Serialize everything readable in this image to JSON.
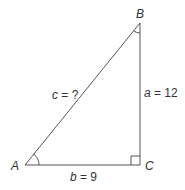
{
  "diagram": {
    "type": "right-triangle",
    "vertices": {
      "A": {
        "label": "A"
      },
      "B": {
        "label": "B"
      },
      "C": {
        "label": "C"
      }
    },
    "sides": {
      "a": {
        "var": "a",
        "eq": " = 12"
      },
      "b": {
        "var": "b",
        "eq": " = 9"
      },
      "c": {
        "var": "c",
        "eq": " = ?"
      }
    },
    "right_angle_at": "C",
    "marked_angles": [
      "A",
      "B"
    ],
    "stroke_color": "#555555"
  }
}
